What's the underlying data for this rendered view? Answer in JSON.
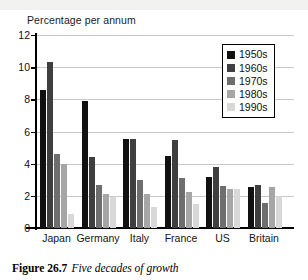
{
  "figure": {
    "caption_number": "Figure 26.7",
    "caption_text": "Five decades of growth"
  },
  "chart_data": {
    "type": "bar",
    "title": "Percentage per annum",
    "xlabel": "",
    "ylabel": "Percentage per annum",
    "ylim": [
      0,
      12
    ],
    "yticks": [
      0,
      2,
      4,
      6,
      8,
      10,
      12
    ],
    "ytick_labels": [
      "0",
      "2",
      "4",
      "6",
      "8",
      "10",
      "12"
    ],
    "grid": true,
    "legend_position": "top-right",
    "categories": [
      "Japan",
      "Germany",
      "Italy",
      "France",
      "US",
      "Britain"
    ],
    "series": [
      {
        "name": "1950s",
        "color": "#111111",
        "values": [
          8.6,
          7.9,
          5.55,
          4.5,
          3.2,
          2.55
        ]
      },
      {
        "name": "1960s",
        "color": "#3f3f3f",
        "values": [
          10.3,
          4.4,
          5.55,
          5.45,
          3.8,
          2.7
        ]
      },
      {
        "name": "1970s",
        "color": "#6e6e6e",
        "values": [
          4.6,
          2.65,
          3.0,
          3.1,
          2.6,
          1.55
        ]
      },
      {
        "name": "1980s",
        "color": "#a6a6a6",
        "values": [
          4.0,
          2.1,
          2.1,
          2.25,
          2.45,
          2.55
        ]
      },
      {
        "name": "1990s",
        "color": "#d8d8d8",
        "values": [
          0.85,
          1.9,
          1.3,
          1.5,
          2.45,
          2.0
        ]
      }
    ]
  }
}
